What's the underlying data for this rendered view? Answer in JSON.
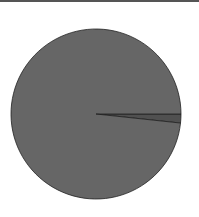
{
  "chart_data": {
    "type": "pie",
    "title": "",
    "labels": [
      "Slice A",
      "Slice B"
    ],
    "values": [
      98.3,
      1.7
    ],
    "colors": [
      "#666666",
      "#505050"
    ],
    "start_angle_deg": 0,
    "direction": "clockwise",
    "legend": false,
    "center": [
      96,
      114
    ],
    "radius": 85
  }
}
